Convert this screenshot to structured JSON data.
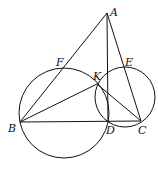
{
  "diagram": {
    "type": "geometry",
    "points": {
      "A": {
        "label": "A",
        "x": 107,
        "y": 13
      },
      "B": {
        "label": "B",
        "x": 20,
        "y": 122
      },
      "C": {
        "label": "C",
        "x": 141,
        "y": 121
      },
      "D": {
        "label": "D",
        "x": 108,
        "y": 122
      },
      "E": {
        "label": "E",
        "x": 125,
        "y": 68
      },
      "F": {
        "label": "F",
        "x": 63,
        "y": 68
      },
      "K": {
        "label": "K",
        "x": 97,
        "y": 84
      }
    },
    "segments": [
      "AB",
      "AC",
      "AD",
      "BC",
      "BK",
      "KC"
    ],
    "circles": [
      {
        "name": "circle-BFKD",
        "cx": 64,
        "cy": 113,
        "r": 45
      },
      {
        "name": "circle-KECD",
        "cx": 125,
        "cy": 97,
        "r": 30
      }
    ],
    "colors": {
      "stroke": "#111111",
      "background": "#ffffff"
    }
  }
}
